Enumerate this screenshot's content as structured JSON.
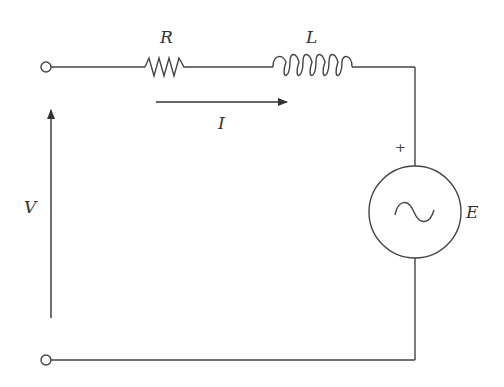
{
  "diagram": {
    "type": "circuit-schematic",
    "stroke_color": "#444444",
    "components": {
      "resistor": {
        "label": "R"
      },
      "inductor": {
        "label": "L"
      },
      "ac_source": {
        "label": "E",
        "polarity_marker": "+"
      }
    },
    "current": {
      "label": "I"
    },
    "voltage": {
      "label": "V"
    }
  }
}
